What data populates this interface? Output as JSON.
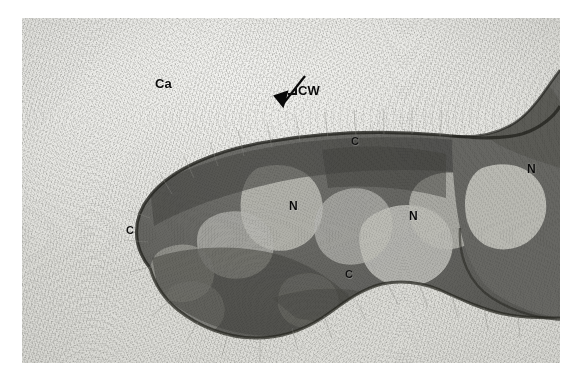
{
  "figure": {
    "kind": "transmission-electron-micrograph",
    "plate_background": "#ffffff",
    "colors": {
      "capsule": "#e6e6e2",
      "cytoplasm": "#6a6a66",
      "nucleoid": "#d6d6d0",
      "cell_wall": "#1e1e1c",
      "label_text": "#0b0b0b"
    },
    "plate": {
      "x": 22,
      "y": 18,
      "width": 538,
      "height": 345
    }
  },
  "labels": [
    {
      "id": "ca",
      "text": "Ca",
      "x": 155,
      "y": 80,
      "meaning": "capsule",
      "style": "lbl-ca"
    },
    {
      "id": "cw",
      "text": "CW",
      "x": 296,
      "y": 89,
      "meaning": "cell wall",
      "style": "lbl-cw"
    },
    {
      "id": "c1",
      "text": "C",
      "x": 351,
      "y": 141,
      "meaning": "cytoplasm",
      "style": "lbl-c"
    },
    {
      "id": "c2",
      "text": "C",
      "x": 126,
      "y": 230,
      "meaning": "cytoplasm",
      "style": "lbl-c"
    },
    {
      "id": "c3",
      "text": "C",
      "x": 345,
      "y": 274,
      "meaning": "cytoplasm",
      "style": "lbl-c"
    },
    {
      "id": "n1",
      "text": "N",
      "x": 289,
      "y": 205,
      "meaning": "nucleoid",
      "style": "lbl-n"
    },
    {
      "id": "n2",
      "text": "N",
      "x": 409,
      "y": 215,
      "meaning": "nucleoid",
      "style": "lbl-n"
    },
    {
      "id": "n3",
      "text": "N",
      "x": 527,
      "y": 168,
      "meaning": "nucleoid",
      "style": "lbl-n-dark"
    }
  ],
  "annotations": {
    "arrow": {
      "id": "cell-wall-arrow",
      "points_to": "cell wall",
      "tail_x": 281,
      "tail_y": 76,
      "tip_x": 259,
      "tip_y": 103
    },
    "cw_bracket": {
      "x": 288,
      "y": 91
    }
  }
}
